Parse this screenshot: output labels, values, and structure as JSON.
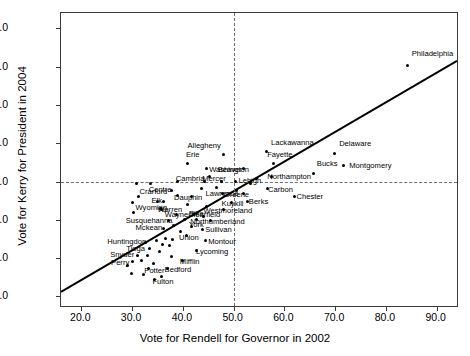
{
  "chart_data": {
    "type": "scatter",
    "title": "",
    "xlabel": "Vote for Rendell for Governor in 2002",
    "ylabel": "Vote for Kerry for President in 2004",
    "xlim": [
      16.0,
      94.0
    ],
    "ylim": [
      17.5,
      94.0
    ],
    "xticks": [
      "20.0",
      "30.0",
      "40.0",
      "50.0",
      "60.0",
      "70.0",
      "80.0",
      "90.0"
    ],
    "xtick_values": [
      20.0,
      30.0,
      40.0,
      50.0,
      60.0,
      70.0,
      80.0,
      90.0
    ],
    "yticks": [
      "20.0",
      "30.0",
      "40.0",
      "50.0",
      "60.0",
      "70.0",
      "80.0",
      "90.0"
    ],
    "ytick_values": [
      20.0,
      30.0,
      40.0,
      50.0,
      60.0,
      70.0,
      80.0,
      90.0
    ],
    "grid": false,
    "legend": "none",
    "reference_lines": [
      {
        "orientation": "vertical",
        "value": 50.0,
        "style": "dashed"
      },
      {
        "orientation": "horizontal",
        "value": 50.0,
        "style": "dashed"
      }
    ],
    "fit_line": {
      "style": "solid",
      "x0": 16.0,
      "y0": 21.2,
      "x1": 94.0,
      "y1": 81.5
    },
    "points": [
      {
        "label": "Philadelphia",
        "x": 84.3,
        "y": 80.4,
        "lx": 4,
        "ly": -11
      },
      {
        "label": "Delaware",
        "x": 69.8,
        "y": 57.3,
        "lx": 5,
        "ly": -10
      },
      {
        "label": "Montgomery",
        "x": 71.6,
        "y": 54.2,
        "lx": 6,
        "ly": 1
      },
      {
        "label": "Bucks",
        "x": 65.8,
        "y": 52.0,
        "lx": 3,
        "ly": -10
      },
      {
        "label": "Lackawanna",
        "x": 56.4,
        "y": 57.8,
        "lx": 5,
        "ly": -9
      },
      {
        "label": "Allegheny",
        "x": 48.0,
        "y": 57.0,
        "lx": -36,
        "ly": -9
      },
      {
        "label": "Erie",
        "x": 41.0,
        "y": 54.7,
        "lx": -2,
        "ly": -9
      },
      {
        "label": "Washington",
        "x": 44.6,
        "y": 53.4,
        "lx": 3,
        "ly": 1
      },
      {
        "label": "Beaver",
        "x": 52.0,
        "y": 53.4,
        "lx": -26,
        "ly": 1
      },
      {
        "label": "Fayette",
        "x": 57.8,
        "y": 54.6,
        "lx": -6,
        "ly": -9
      },
      {
        "label": "Northampton",
        "x": 57.4,
        "y": 51.4,
        "lx": -4,
        "ly": 1
      },
      {
        "label": "Lehigh",
        "x": 54.5,
        "y": 50.7,
        "lx": -18,
        "ly": 2
      },
      {
        "label": "Carbon",
        "x": 56.6,
        "y": 48.1,
        "lx": 1,
        "ly": 1
      },
      {
        "label": "Chester",
        "x": 62.0,
        "y": 46.1,
        "lx": 2,
        "ly": 1
      },
      {
        "label": "Greene",
        "x": 52.0,
        "y": 46.8,
        "lx": -20,
        "ly": 1
      },
      {
        "label": "Berks",
        "x": 52.8,
        "y": 44.8,
        "lx": 1,
        "ly": 1
      },
      {
        "label": "Cambria",
        "x": 39.0,
        "y": 49.9,
        "lx": -2,
        "ly": -3
      },
      {
        "label": "Mercer",
        "x": 44.2,
        "y": 49.9,
        "lx": -2,
        "ly": -3
      },
      {
        "label": "Centre",
        "x": 37.8,
        "y": 47.6,
        "lx": -23,
        "ly": -1
      },
      {
        "label": "Dauphin",
        "x": 41.8,
        "y": 46.0,
        "lx": -18,
        "ly": 1
      },
      {
        "label": "Lawrence",
        "x": 47.8,
        "y": 47.0,
        "lx": -17,
        "ly": 1
      },
      {
        "label": "Elk",
        "x": 36.2,
        "y": 44.9,
        "lx": -12,
        "ly": 0
      },
      {
        "label": "Kuykill",
        "x": 49.6,
        "y": 44.5,
        "lx": -10,
        "ly": 1
      },
      {
        "label": "Westmoreland",
        "x": 48.0,
        "y": 42.6,
        "lx": -20,
        "ly": 1
      },
      {
        "label": "Clearfield",
        "x": 44.0,
        "y": 40.9,
        "lx": -15,
        "ly": -1
      },
      {
        "label": "Northumberland",
        "x": 45.4,
        "y": 39.7,
        "lx": -20,
        "ly": 1
      },
      {
        "label": "Warren",
        "x": 35.6,
        "y": 42.9,
        "lx": -3,
        "ly": 1
      },
      {
        "label": "Wayne",
        "x": 38.8,
        "y": 41.5,
        "lx": -12,
        "ly": 1
      },
      {
        "label": "Pike",
        "x": 42.0,
        "y": 41.5,
        "lx": -4,
        "ly": 0
      },
      {
        "label": "Crarford",
        "x": 35.0,
        "y": 44.9,
        "lx": -18,
        "ly": -9
      },
      {
        "label": "Wyoming",
        "x": 35.8,
        "y": 42.7,
        "lx": -26,
        "ly": -1
      },
      {
        "label": "Susquehanna",
        "x": 37.2,
        "y": 39.8,
        "lx": -43,
        "ly": 0
      },
      {
        "label": "Mckean",
        "x": 36.2,
        "y": 37.8,
        "lx": -28,
        "ly": 0
      },
      {
        "label": "York",
        "x": 41.8,
        "y": 38.3,
        "lx": -3,
        "ly": -1
      },
      {
        "label": "Sullivan",
        "x": 43.8,
        "y": 37.5,
        "lx": 3,
        "ly": 1
      },
      {
        "label": "Union",
        "x": 40.8,
        "y": 35.8,
        "lx": -8,
        "ly": 2
      },
      {
        "label": "Montour",
        "x": 44.4,
        "y": 34.6,
        "lx": 3,
        "ly": 1
      },
      {
        "label": "Huntingdon",
        "x": 32.6,
        "y": 34.2,
        "lx": -38,
        "ly": 0
      },
      {
        "label": "Tioga",
        "x": 33.4,
        "y": 32.6,
        "lx": -23,
        "ly": 1
      },
      {
        "label": "Lycoming",
        "x": 42.6,
        "y": 32.0,
        "lx": 0,
        "ly": 2
      },
      {
        "label": "Snyder",
        "x": 31.0,
        "y": 30.8,
        "lx": -27,
        "ly": 0
      },
      {
        "label": "Mifflin",
        "x": 40.0,
        "y": 29.4,
        "lx": -3,
        "ly": 2
      },
      {
        "label": "Perry",
        "x": 30.0,
        "y": 29.1,
        "lx": -21,
        "ly": 1
      },
      {
        "label": "Potter",
        "x": 33.2,
        "y": 27.2,
        "lx": -4,
        "ly": 2
      },
      {
        "label": "Bedford",
        "x": 37.0,
        "y": 27.2,
        "lx": -3,
        "ly": 1
      },
      {
        "label": "Fulton",
        "x": 34.4,
        "y": 24.4,
        "lx": -2,
        "ly": 2
      },
      {
        "label": "",
        "x": 47.6,
        "y": 50.0,
        "lx": 0,
        "ly": 0
      },
      {
        "label": "",
        "x": 50.4,
        "y": 49.9,
        "lx": 0,
        "ly": 0
      },
      {
        "label": "",
        "x": 53.4,
        "y": 49.6,
        "lx": 0,
        "ly": 0
      },
      {
        "label": "",
        "x": 33.6,
        "y": 49.6,
        "lx": 0,
        "ly": 0
      },
      {
        "label": "",
        "x": 30.8,
        "y": 49.4,
        "lx": 0,
        "ly": 0
      },
      {
        "label": "",
        "x": 45.2,
        "y": 51.4,
        "lx": 0,
        "ly": 0
      },
      {
        "label": "",
        "x": 46.6,
        "y": 48.4,
        "lx": 0,
        "ly": 0
      },
      {
        "label": "",
        "x": 43.6,
        "y": 48.2,
        "lx": 0,
        "ly": 0
      },
      {
        "label": "",
        "x": 50.6,
        "y": 47.6,
        "lx": 0,
        "ly": 0
      },
      {
        "label": "",
        "x": 39.0,
        "y": 46.4,
        "lx": 0,
        "ly": 0
      },
      {
        "label": "",
        "x": 31.2,
        "y": 46.2,
        "lx": 0,
        "ly": 0
      },
      {
        "label": "",
        "x": 30.0,
        "y": 44.6,
        "lx": 0,
        "ly": 0
      },
      {
        "label": "",
        "x": 41.0,
        "y": 44.0,
        "lx": 0,
        "ly": 0
      },
      {
        "label": "",
        "x": 44.6,
        "y": 43.4,
        "lx": 0,
        "ly": 0
      },
      {
        "label": "",
        "x": 30.2,
        "y": 41.8,
        "lx": 0,
        "ly": 0
      },
      {
        "label": "",
        "x": 40.4,
        "y": 40.2,
        "lx": 0,
        "ly": 0
      },
      {
        "label": "",
        "x": 42.6,
        "y": 40.0,
        "lx": 0,
        "ly": 0
      },
      {
        "label": "",
        "x": 38.2,
        "y": 38.4,
        "lx": 0,
        "ly": 0
      },
      {
        "label": "",
        "x": 39.6,
        "y": 37.0,
        "lx": 0,
        "ly": 0
      },
      {
        "label": "",
        "x": 36.6,
        "y": 35.2,
        "lx": 0,
        "ly": 0
      },
      {
        "label": "",
        "x": 38.0,
        "y": 34.8,
        "lx": 0,
        "ly": 0
      },
      {
        "label": "",
        "x": 34.8,
        "y": 34.6,
        "lx": 0,
        "ly": 0
      },
      {
        "label": "",
        "x": 36.0,
        "y": 33.6,
        "lx": 0,
        "ly": 0
      },
      {
        "label": "",
        "x": 37.4,
        "y": 33.2,
        "lx": 0,
        "ly": 0
      },
      {
        "label": "",
        "x": 35.4,
        "y": 31.6,
        "lx": 0,
        "ly": 0
      },
      {
        "label": "",
        "x": 33.0,
        "y": 30.6,
        "lx": 0,
        "ly": 0
      },
      {
        "label": "",
        "x": 37.8,
        "y": 30.4,
        "lx": 0,
        "ly": 0
      },
      {
        "label": "",
        "x": 31.8,
        "y": 29.4,
        "lx": 0,
        "ly": 0
      },
      {
        "label": "",
        "x": 34.2,
        "y": 28.6,
        "lx": 0,
        "ly": 0
      },
      {
        "label": "",
        "x": 29.0,
        "y": 28.2,
        "lx": 0,
        "ly": 0
      },
      {
        "label": "",
        "x": 29.8,
        "y": 26.0,
        "lx": 0,
        "ly": 0
      },
      {
        "label": "",
        "x": 32.2,
        "y": 25.6,
        "lx": 0,
        "ly": 0
      },
      {
        "label": "",
        "x": 35.8,
        "y": 25.2,
        "lx": 0,
        "ly": 0
      }
    ]
  }
}
